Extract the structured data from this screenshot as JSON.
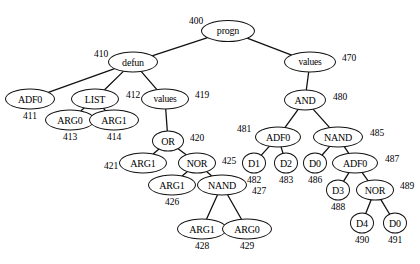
{
  "figure": {
    "stroke_color": "#111111",
    "background_color": "#ffffff",
    "width": 420,
    "height": 264
  },
  "nodes": [
    {
      "id": "n400",
      "label": "progn",
      "tag": "400",
      "x": 228,
      "y": 31,
      "rx": 27,
      "ry": 11,
      "font": 10,
      "tag_x": 196,
      "tag_y": 22
    },
    {
      "id": "n410",
      "label": "defun",
      "tag": "410",
      "x": 133,
      "y": 62,
      "rx": 25,
      "ry": 10.5,
      "font": 10,
      "tag_x": 101,
      "tag_y": 55
    },
    {
      "id": "n470",
      "label": "values",
      "tag": "470",
      "x": 310,
      "y": 62,
      "rx": 26,
      "ry": 10.5,
      "font": 9.5,
      "tag_x": 349,
      "tag_y": 59
    },
    {
      "id": "n411",
      "label": "ADF0",
      "tag": "411",
      "x": 30,
      "y": 99,
      "rx": 25,
      "ry": 10.5,
      "font": 10,
      "tag_x": 30,
      "tag_y": 117
    },
    {
      "id": "n412",
      "label": "LIST",
      "tag": "412",
      "x": 95,
      "y": 99,
      "rx": 24,
      "ry": 10.5,
      "font": 10,
      "tag_x": 133,
      "tag_y": 96
    },
    {
      "id": "n419",
      "label": "values",
      "tag": "419",
      "x": 165,
      "y": 99,
      "rx": 24,
      "ry": 10.5,
      "font": 9.5,
      "tag_x": 202,
      "tag_y": 96
    },
    {
      "id": "n480",
      "label": "AND",
      "tag": "480",
      "x": 305,
      "y": 100,
      "rx": 21,
      "ry": 10.5,
      "font": 10,
      "tag_x": 340,
      "tag_y": 98
    },
    {
      "id": "n413",
      "label": "ARG0",
      "tag": "413",
      "x": 70,
      "y": 120,
      "rx": 25,
      "ry": 10.5,
      "font": 10,
      "tag_x": 70,
      "tag_y": 138
    },
    {
      "id": "n414",
      "label": "ARG1",
      "tag": "414",
      "x": 114,
      "y": 120,
      "rx": 25,
      "ry": 10.5,
      "font": 10,
      "tag_x": 114,
      "tag_y": 138
    },
    {
      "id": "n420",
      "label": "OR",
      "tag": "420",
      "x": 168,
      "y": 141,
      "rx": 16,
      "ry": 10.5,
      "font": 10,
      "tag_x": 197,
      "tag_y": 139
    },
    {
      "id": "n481",
      "label": "ADF0",
      "tag": "481",
      "x": 278,
      "y": 137,
      "rx": 23,
      "ry": 10.5,
      "font": 10,
      "tag_x": 244,
      "tag_y": 130
    },
    {
      "id": "n485",
      "label": "NAND",
      "tag": "485",
      "x": 338,
      "y": 137,
      "rx": 25,
      "ry": 10.5,
      "font": 10,
      "tag_x": 377,
      "tag_y": 134
    },
    {
      "id": "n421",
      "label": "ARG1",
      "tag": "421",
      "x": 143,
      "y": 163,
      "rx": 24,
      "ry": 10.5,
      "font": 10,
      "tag_x": 111,
      "tag_y": 167
    },
    {
      "id": "n425",
      "label": "NOR",
      "tag": "425",
      "x": 197,
      "y": 163,
      "rx": 19,
      "ry": 10.5,
      "font": 10,
      "tag_x": 229,
      "tag_y": 162
    },
    {
      "id": "n482",
      "label": "D1",
      "tag": "482",
      "x": 254,
      "y": 163,
      "rx": 12,
      "ry": 10.5,
      "font": 10,
      "tag_x": 254,
      "tag_y": 181
    },
    {
      "id": "n483",
      "label": "D2",
      "tag": "483",
      "x": 286,
      "y": 163,
      "rx": 12,
      "ry": 10.5,
      "font": 10,
      "tag_x": 286,
      "tag_y": 181
    },
    {
      "id": "n486",
      "label": "D0",
      "tag": "486",
      "x": 315,
      "y": 163,
      "rx": 12,
      "ry": 10.5,
      "font": 10,
      "tag_x": 315,
      "tag_y": 181
    },
    {
      "id": "n487",
      "label": "ADF0",
      "tag": "487",
      "x": 355,
      "y": 163,
      "rx": 23,
      "ry": 10.5,
      "font": 10,
      "tag_x": 392,
      "tag_y": 160
    },
    {
      "id": "n426",
      "label": "ARG1",
      "tag": "426",
      "x": 172,
      "y": 185,
      "rx": 24,
      "ry": 10.5,
      "font": 10,
      "tag_x": 172,
      "tag_y": 203
    },
    {
      "id": "n427",
      "label": "NAND",
      "tag": "427",
      "x": 222,
      "y": 185,
      "rx": 25,
      "ry": 10.5,
      "font": 10,
      "tag_x": 259,
      "tag_y": 192
    },
    {
      "id": "n488",
      "label": "D3",
      "tag": "488",
      "x": 338,
      "y": 190,
      "rx": 12,
      "ry": 10.5,
      "font": 10,
      "tag_x": 338,
      "tag_y": 208
    },
    {
      "id": "n489",
      "label": "NOR",
      "tag": "489",
      "x": 375,
      "y": 190,
      "rx": 19,
      "ry": 10.5,
      "font": 10,
      "tag_x": 407,
      "tag_y": 187
    },
    {
      "id": "n428",
      "label": "ARG1",
      "tag": "428",
      "x": 202,
      "y": 229,
      "rx": 25,
      "ry": 10.5,
      "font": 10,
      "tag_x": 202,
      "tag_y": 247
    },
    {
      "id": "n429",
      "label": "ARG0",
      "tag": "429",
      "x": 247,
      "y": 229,
      "rx": 25,
      "ry": 10.5,
      "font": 10,
      "tag_x": 247,
      "tag_y": 247
    },
    {
      "id": "n490",
      "label": "D4",
      "tag": "490",
      "x": 362,
      "y": 223,
      "rx": 12,
      "ry": 10.5,
      "font": 10,
      "tag_x": 362,
      "tag_y": 241
    },
    {
      "id": "n491",
      "label": "D0",
      "tag": "491",
      "x": 395,
      "y": 223,
      "rx": 12,
      "ry": 10.5,
      "font": 10,
      "tag_x": 395,
      "tag_y": 241
    }
  ],
  "edges": [
    {
      "from": "n400",
      "to": "n410"
    },
    {
      "from": "n400",
      "to": "n470"
    },
    {
      "from": "n410",
      "to": "n411"
    },
    {
      "from": "n410",
      "to": "n412"
    },
    {
      "from": "n410",
      "to": "n419"
    },
    {
      "from": "n412",
      "to": "n413"
    },
    {
      "from": "n412",
      "to": "n414"
    },
    {
      "from": "n419",
      "to": "n420"
    },
    {
      "from": "n420",
      "to": "n421"
    },
    {
      "from": "n420",
      "to": "n425"
    },
    {
      "from": "n425",
      "to": "n426"
    },
    {
      "from": "n425",
      "to": "n427"
    },
    {
      "from": "n427",
      "to": "n428"
    },
    {
      "from": "n427",
      "to": "n429"
    },
    {
      "from": "n470",
      "to": "n480"
    },
    {
      "from": "n480",
      "to": "n481"
    },
    {
      "from": "n480",
      "to": "n485"
    },
    {
      "from": "n481",
      "to": "n482"
    },
    {
      "from": "n481",
      "to": "n483"
    },
    {
      "from": "n485",
      "to": "n486"
    },
    {
      "from": "n485",
      "to": "n487"
    },
    {
      "from": "n487",
      "to": "n488"
    },
    {
      "from": "n487",
      "to": "n489"
    },
    {
      "from": "n489",
      "to": "n490"
    },
    {
      "from": "n489",
      "to": "n491"
    }
  ]
}
